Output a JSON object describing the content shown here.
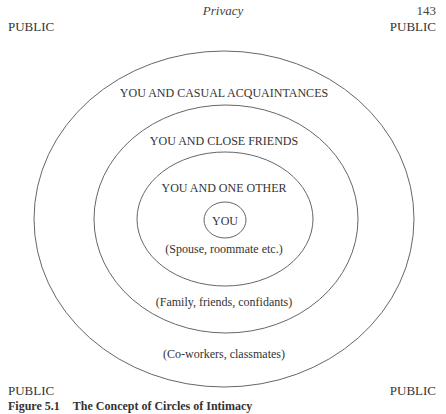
{
  "header": {
    "running_title": "Privacy",
    "page_number": "143"
  },
  "corners": {
    "top_left": "PUBLIC",
    "top_right": "PUBLIC",
    "bottom_left": "PUBLIC",
    "bottom_right": "PUBLIC"
  },
  "diagram": {
    "rings": [
      {
        "id": "casual",
        "title": "YOU AND CASUAL ACQUAINTANCES",
        "subtitle": "(Co-workers, classmates)"
      },
      {
        "id": "close",
        "title": "YOU AND CLOSE FRIENDS",
        "subtitle": "(Family, friends, confidants)"
      },
      {
        "id": "one-other",
        "title": "YOU AND ONE OTHER",
        "subtitle": "(Spouse, roommate etc.)"
      },
      {
        "id": "you",
        "title": "YOU"
      }
    ],
    "stroke_color": "#555555"
  },
  "caption": {
    "label": "Figure 5.1",
    "title": "The Concept of Circles of Intimacy"
  }
}
